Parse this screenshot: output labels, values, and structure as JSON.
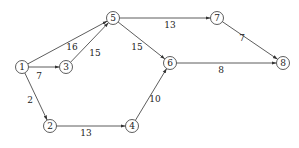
{
  "diagram": {
    "type": "directed-weighted-graph",
    "colors": {
      "stroke": "#333333",
      "text": "#222222",
      "background": "#ffffff"
    },
    "nodes": [
      {
        "id": "1",
        "label": "1",
        "x": 22,
        "y": 67
      },
      {
        "id": "2",
        "label": "2",
        "x": 50,
        "y": 126
      },
      {
        "id": "3",
        "label": "3",
        "x": 66,
        "y": 67
      },
      {
        "id": "4",
        "label": "4",
        "x": 132,
        "y": 126
      },
      {
        "id": "5",
        "label": "5",
        "x": 113,
        "y": 18
      },
      {
        "id": "6",
        "label": "6",
        "x": 170,
        "y": 63
      },
      {
        "id": "7",
        "label": "7",
        "x": 217,
        "y": 18
      },
      {
        "id": "8",
        "label": "8",
        "x": 283,
        "y": 63
      }
    ],
    "edges": [
      {
        "from": "1",
        "to": "5",
        "weight": "16",
        "lx": 72,
        "ly": 50
      },
      {
        "from": "1",
        "to": "3",
        "weight": "7",
        "lx": 39,
        "ly": 79
      },
      {
        "from": "1",
        "to": "2",
        "weight": "2",
        "lx": 30,
        "ly": 103
      },
      {
        "from": "3",
        "to": "5",
        "weight": "15",
        "lx": 95,
        "ly": 56
      },
      {
        "from": "5",
        "to": "7",
        "weight": "13",
        "lx": 170,
        "ly": 28
      },
      {
        "from": "5",
        "to": "6",
        "weight": "15",
        "lx": 137,
        "ly": 50
      },
      {
        "from": "2",
        "to": "4",
        "weight": "13",
        "lx": 86,
        "ly": 136
      },
      {
        "from": "4",
        "to": "6",
        "weight": "10",
        "lx": 155,
        "ly": 102
      },
      {
        "from": "6",
        "to": "8",
        "weight": "8",
        "lx": 221,
        "ly": 73
      },
      {
        "from": "7",
        "to": "8",
        "weight": "7",
        "lx": 242,
        "ly": 41
      }
    ]
  }
}
